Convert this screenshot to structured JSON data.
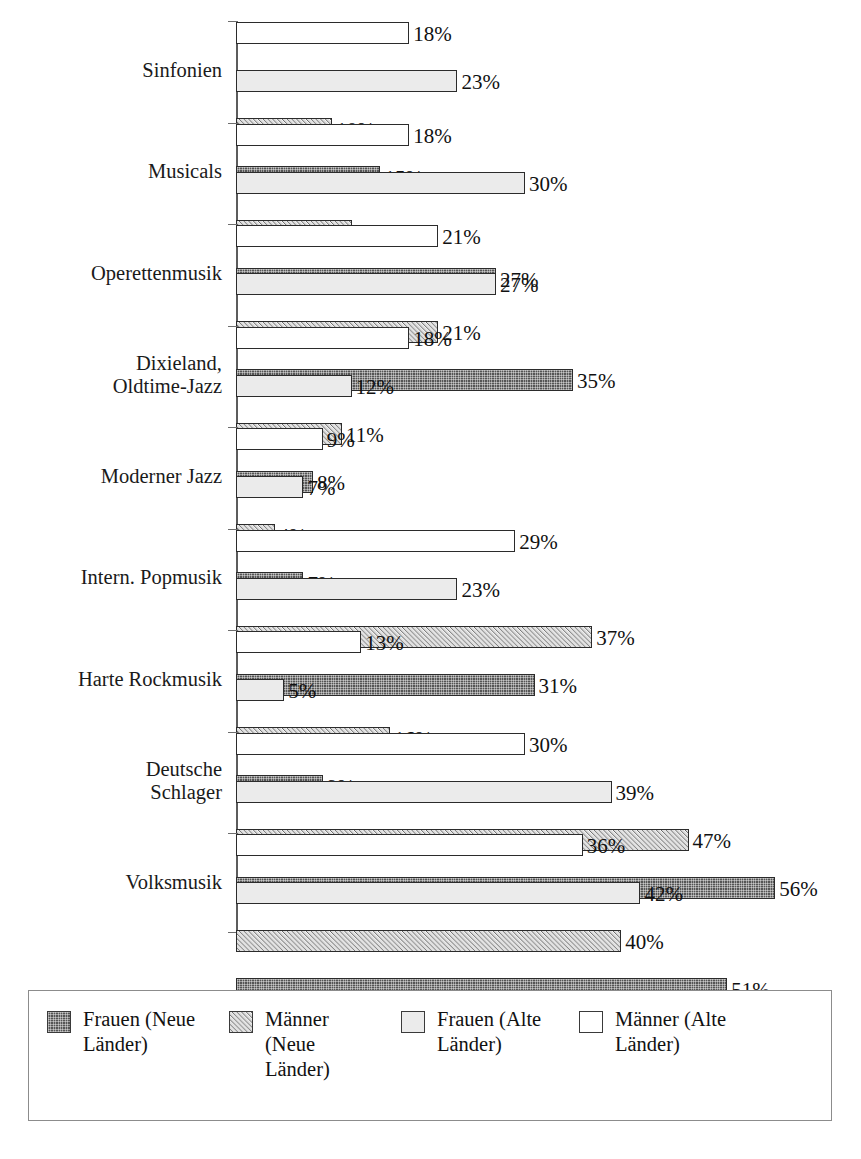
{
  "chart_data": {
    "type": "bar",
    "orientation": "horizontal",
    "title": "",
    "subtitle": "",
    "xlabel": "",
    "ylabel": "",
    "xlim": [
      0,
      60
    ],
    "grid": false,
    "value_suffix": "%",
    "legend_position": "bottom",
    "axis_scale_px_per_percent": 9.63,
    "categories": [
      "Sinfonien",
      "Musicals",
      "Operettenmusik",
      "Dixieland, Oldtime-Jazz",
      "Moderner Jazz",
      "Intern. Popmusik",
      "Harte Rockmusik",
      "Deutsche Schlager",
      "Volksmusik"
    ],
    "category_lines": [
      [
        "Sinfonien"
      ],
      [
        "Musicals"
      ],
      [
        "Operettenmusik"
      ],
      [
        "Dixieland,",
        "Oldtime-Jazz"
      ],
      [
        "Moderner Jazz"
      ],
      [
        "Intern. Popmusik"
      ],
      [
        "Harte Rockmusik"
      ],
      [
        "Deutsche",
        "Schlager"
      ],
      [
        "Volksmusik"
      ]
    ],
    "series": [
      {
        "name": "Männer (Alte Länder)",
        "key": "maennerAlt",
        "fill": "white",
        "values": [
          18,
          18,
          21,
          18,
          9,
          29,
          13,
          30,
          36
        ],
        "labels": [
          "18%",
          "18%",
          "21%",
          "18%",
          "9%",
          "29%",
          "13%",
          "30%",
          "36%"
        ]
      },
      {
        "name": "Frauen (Alte Länder)",
        "key": "frauenAlt",
        "fill": "light-gray",
        "values": [
          23,
          30,
          27,
          12,
          7,
          23,
          5,
          39,
          42
        ],
        "labels": [
          "23%",
          "30%",
          "27%",
          "12%",
          "7%",
          "23%",
          "5%",
          "39%",
          "42%"
        ]
      },
      {
        "name": "Männer (Neue Länder)",
        "key": "maennerNeu",
        "fill": "diagonal-hatch",
        "values": [
          10,
          12,
          21,
          11,
          4,
          37,
          16,
          47,
          40
        ],
        "labels": [
          "10%",
          "12%",
          "21%",
          "11%",
          "4%",
          "37%",
          "16%",
          "47%",
          "40%"
        ]
      },
      {
        "name": "Frauen (Neue Länder)",
        "key": "frauenNeu",
        "fill": "dark-crosshatch",
        "values": [
          15,
          27,
          35,
          8,
          7,
          31,
          9,
          56,
          51
        ],
        "labels": [
          "15%",
          "27%",
          "35%",
          "8%",
          "7%",
          "31%",
          "9%",
          "56%",
          "51%"
        ]
      }
    ]
  },
  "legend": {
    "items": [
      {
        "label": "Frauen (Neue Länder)",
        "lines": [
          "Frauen (Neue",
          "Länder)"
        ],
        "fill": "dark-crosshatch",
        "key": "frauenNeu"
      },
      {
        "label": "Männer (Neue Länder)",
        "lines": [
          "Männer",
          "(Neue",
          "Länder)"
        ],
        "fill": "diagonal-hatch",
        "key": "maennerNeu"
      },
      {
        "label": "Frauen (Alte Länder)",
        "lines": [
          "Frauen (Alte",
          "Länder)"
        ],
        "fill": "light-gray",
        "key": "frauenAlt"
      },
      {
        "label": "Männer (Alte Länder)",
        "lines": [
          "Männer (Alte",
          "Länder)"
        ],
        "fill": "white",
        "key": "maennerAlt"
      }
    ]
  },
  "colors": {
    "axis": "#5c5c5c",
    "bar_border": "#2b2b2b",
    "white_fill": "#ffffff",
    "light_gray_fill": "#ebebeb",
    "hatch_fill": "#b9b9b9",
    "dark_fill": "#555555",
    "legend_border": "#8c8c8c",
    "text": "#111111"
  }
}
